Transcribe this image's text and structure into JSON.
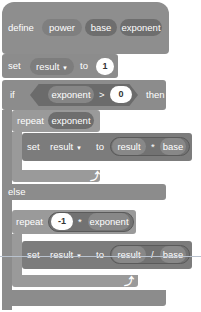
{
  "define_block": {
    "keyword": "define",
    "name": "power",
    "params": [
      "base",
      "exponent"
    ]
  },
  "set_init": {
    "keyword": "set",
    "variable": "result",
    "dropdown": "▼",
    "to": "to",
    "value": "1"
  },
  "if_block": {
    "keyword": "if",
    "condition": {
      "left": "exponent",
      "op": ">",
      "right": "0"
    },
    "then": "then",
    "else": "else"
  },
  "repeat_then": {
    "keyword": "repeat",
    "count": "exponent",
    "set": {
      "keyword": "set",
      "variable": "result",
      "dropdown": "▼",
      "to": "to",
      "expr": {
        "left": "result",
        "op": "*",
        "right": "base"
      }
    },
    "loop_arrow": "⤴"
  },
  "repeat_else": {
    "keyword": "repeat",
    "count": {
      "left": "-1",
      "op": "*",
      "right": "exponent"
    },
    "set": {
      "keyword": "set",
      "variable": "result",
      "dropdown": "▼",
      "to": "to",
      "expr": {
        "left": "result",
        "op": "/",
        "right": "base"
      }
    },
    "loop_arrow": "⤴"
  },
  "colors": {
    "block": "#8c8c8c",
    "inner": "#9a9a9a",
    "reporter": "#6e6e6e",
    "number_bg": "#ffffff"
  }
}
